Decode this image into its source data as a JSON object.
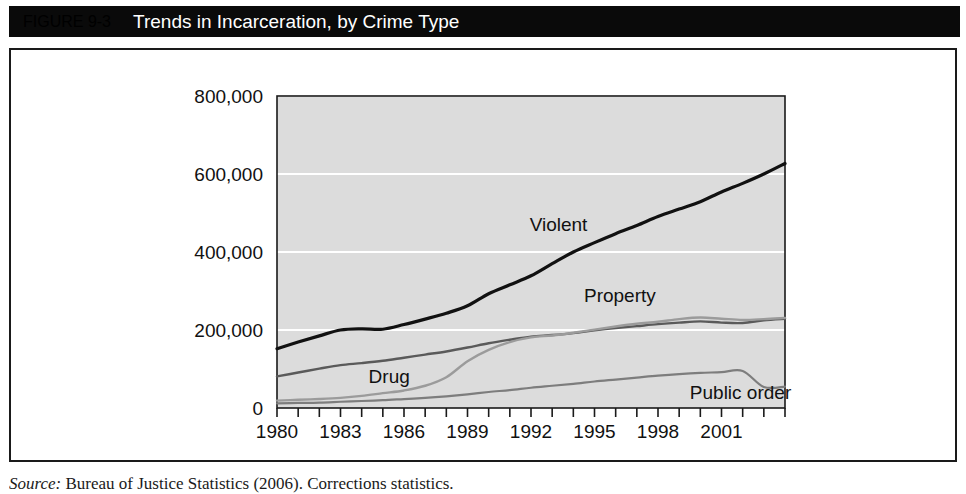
{
  "figure": {
    "number": "FIGURE 9-3",
    "title": "Trends in Incarceration, by Crime Type",
    "source_label": "Source:",
    "source_text": " Bureau of Justice Statistics (2006). Corrections statistics."
  },
  "chart_data": {
    "type": "line",
    "title": "Trends in Incarceration, by Crime Type",
    "xlabel": "",
    "ylabel": "",
    "xlim": [
      1980,
      2004
    ],
    "ylim": [
      0,
      800000
    ],
    "grid": true,
    "legend_position": "inline-labels",
    "ytick_labels": [
      "0",
      "200,000",
      "400,000",
      "600,000",
      "800,000"
    ],
    "ytick_values": [
      0,
      200000,
      400000,
      600000,
      800000
    ],
    "xtick_labels": [
      "1980",
      "1983",
      "1986",
      "1989",
      "1992",
      "1995",
      "1998",
      "2001"
    ],
    "xtick_values": [
      1980,
      1983,
      1986,
      1989,
      1992,
      1995,
      1998,
      2001
    ],
    "x": [
      1980,
      1981,
      1982,
      1983,
      1984,
      1985,
      1986,
      1987,
      1988,
      1989,
      1990,
      1991,
      1992,
      1993,
      1994,
      1995,
      1996,
      1997,
      1998,
      1999,
      2000,
      2001,
      2002,
      2003,
      2004
    ],
    "series": [
      {
        "name": "Violent",
        "color": "#111111",
        "width": 3.2,
        "label_x": 1993.3,
        "label_y": 455000,
        "values": [
          152000,
          169000,
          185000,
          200000,
          203000,
          202000,
          214000,
          228000,
          243000,
          262000,
          293000,
          316000,
          339000,
          370000,
          400000,
          424000,
          447000,
          468000,
          491000,
          510000,
          529000,
          554000,
          576000,
          600000,
          627000
        ]
      },
      {
        "name": "Property",
        "color": "#5a5a5a",
        "width": 2.4,
        "label_x": 1996.2,
        "label_y": 272000,
        "values": [
          81000,
          91000,
          101000,
          110000,
          115000,
          121000,
          129000,
          137000,
          145000,
          155000,
          166000,
          175000,
          183000,
          187000,
          192000,
          199000,
          205000,
          210000,
          215000,
          219000,
          222000,
          219000,
          218000,
          225000,
          229000
        ]
      },
      {
        "name": "Drug",
        "color": "#9b9b9b",
        "width": 2.4,
        "label_x": 1985.3,
        "label_y": 64000,
        "values": [
          19000,
          21000,
          23000,
          26000,
          31000,
          38000,
          45000,
          57000,
          79000,
          120000,
          149000,
          169000,
          181000,
          186000,
          193000,
          201000,
          209000,
          216000,
          221000,
          228000,
          232000,
          229000,
          226000,
          228000,
          231000
        ]
      },
      {
        "name": "Public order",
        "color": "#7d7d7d",
        "width": 2.2,
        "label_x": 2001.9,
        "label_y": 23000,
        "values": [
          12000,
          13000,
          14000,
          16000,
          18000,
          20000,
          23000,
          26000,
          30000,
          35000,
          41000,
          46000,
          52000,
          57000,
          62000,
          68000,
          73000,
          78000,
          83000,
          87000,
          90000,
          92000,
          95000,
          54000,
          55000
        ]
      }
    ],
    "plot_bg_color": "#dcdcdc",
    "grid_color": "#ffffff",
    "axis_color": "#1a1a1a"
  }
}
